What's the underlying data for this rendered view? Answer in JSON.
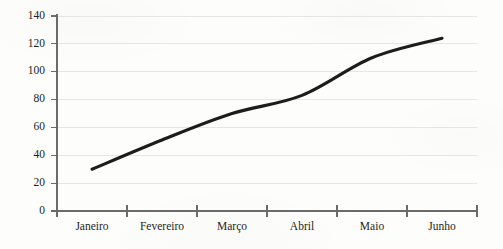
{
  "chart_data": {
    "type": "line",
    "title": "",
    "subtitle": "",
    "xlabel": "",
    "ylabel": "",
    "categories": [
      "Janeiro",
      "Fevereiro",
      "Março",
      "Abril",
      "Maio",
      "Junho"
    ],
    "values": [
      30,
      51,
      70,
      83,
      110,
      124
    ],
    "series": [
      {
        "name": "",
        "values": [
          30,
          51,
          70,
          83,
          110,
          124
        ],
        "color": "#1c1c1c"
      }
    ],
    "ylim": [
      0,
      140
    ],
    "yticks": [
      0,
      20,
      40,
      60,
      80,
      100,
      120,
      140
    ],
    "ytick_labels": [
      "0",
      "20",
      "40",
      "60",
      "80",
      "100",
      "120",
      "140"
    ],
    "grid": true,
    "grid_axis": "y",
    "grid_color": "#e6e6e6",
    "legend": false,
    "legend_position": "none",
    "markers": false,
    "smoothing": true,
    "annotations": [],
    "background_color": "#fdfdfc",
    "axis_color": "#6b6b6b",
    "text_color": "#231f20"
  },
  "axes": {
    "y": {
      "tick_0": "0",
      "tick_1": "20",
      "tick_2": "40",
      "tick_3": "60",
      "tick_4": "80",
      "tick_5": "100",
      "tick_6": "120",
      "tick_7": "140"
    },
    "x": {
      "tick_0": "Janeiro",
      "tick_1": "Fevereiro",
      "tick_2": "Março",
      "tick_3": "Abril",
      "tick_4": "Maio",
      "tick_5": "Junho"
    }
  }
}
